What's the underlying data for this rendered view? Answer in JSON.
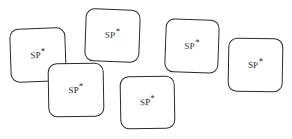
{
  "figure": {
    "background_color": "#ffffff",
    "stroke_color": "#2a2a2a",
    "text_color": "#1a1a1a",
    "width": 292,
    "height": 139,
    "node_count": 6
  },
  "nodes": [
    {
      "id": "sp-node-1",
      "label": "SP",
      "superscript": "*",
      "x": 10,
      "y": 28,
      "width": 56,
      "height": 54,
      "rotation": -2,
      "z": 1
    },
    {
      "id": "sp-node-2",
      "label": "SP",
      "superscript": "*",
      "x": 48,
      "y": 63,
      "width": 56,
      "height": 54,
      "rotation": -1,
      "z": 2
    },
    {
      "id": "sp-node-3",
      "label": "SP",
      "superscript": "*",
      "x": 85,
      "y": 9,
      "width": 55,
      "height": 53,
      "rotation": 2,
      "z": 3
    },
    {
      "id": "sp-node-4",
      "label": "SP",
      "superscript": "*",
      "x": 120,
      "y": 76,
      "width": 55,
      "height": 53,
      "rotation": -1,
      "z": 4
    },
    {
      "id": "sp-node-5",
      "label": "SP",
      "superscript": "*",
      "x": 165,
      "y": 19,
      "width": 54,
      "height": 54,
      "rotation": 2,
      "z": 5
    },
    {
      "id": "sp-node-6",
      "label": "SP",
      "superscript": "*",
      "x": 228,
      "y": 38,
      "width": 55,
      "height": 54,
      "rotation": 1,
      "z": 6
    }
  ]
}
